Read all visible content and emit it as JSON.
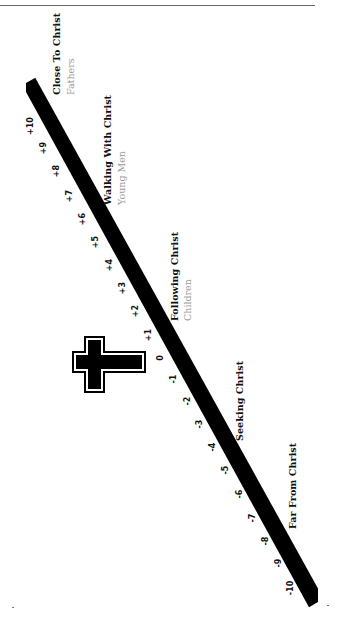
{
  "diagram": {
    "type": "spiritual-growth-scale",
    "bar": {
      "x1": 27,
      "y1": 83,
      "x2": 318,
      "y2": 602,
      "width": 15,
      "color": "#000000"
    },
    "scale": {
      "ticks": [
        {
          "label": "+10",
          "x": 31,
          "y": 126
        },
        {
          "label": "+9",
          "x": 44,
          "y": 148
        },
        {
          "label": "+8",
          "x": 57,
          "y": 171
        },
        {
          "label": "+7",
          "x": 70,
          "y": 196
        },
        {
          "label": "+6",
          "x": 83,
          "y": 219
        },
        {
          "label": "+5",
          "x": 96,
          "y": 242
        },
        {
          "label": "+4",
          "x": 110,
          "y": 265
        },
        {
          "label": "+3",
          "x": 123,
          "y": 288
        },
        {
          "label": "+2",
          "x": 136,
          "y": 311
        },
        {
          "label": "+1",
          "x": 149,
          "y": 335
        },
        {
          "label": "0",
          "x": 161,
          "y": 358
        },
        {
          "label": "-1",
          "x": 174,
          "y": 379
        },
        {
          "label": "-2",
          "x": 188,
          "y": 401
        },
        {
          "label": "-3",
          "x": 200,
          "y": 424
        },
        {
          "label": "-4",
          "x": 213,
          "y": 447
        },
        {
          "label": "-5",
          "x": 226,
          "y": 470
        },
        {
          "label": "-6",
          "x": 240,
          "y": 494
        },
        {
          "label": "-7",
          "x": 253,
          "y": 518
        },
        {
          "label": "-8",
          "x": 266,
          "y": 541
        },
        {
          "label": "-9",
          "x": 279,
          "y": 563
        },
        {
          "label": "-10",
          "x": 291,
          "y": 588
        }
      ]
    },
    "stages": [
      {
        "title": "Close To Christ",
        "subtitle": "Fathers",
        "x": 52,
        "y_bottom": 95,
        "sub_x": 66,
        "sub_y_bottom": 95
      },
      {
        "title": "Walking With Christ",
        "subtitle": "Young Men",
        "x": 103,
        "y_bottom": 205,
        "sub_x": 117,
        "sub_y_bottom": 205
      },
      {
        "title": "Following Christ",
        "subtitle": "Children",
        "x": 170,
        "y_bottom": 321,
        "sub_x": 183,
        "sub_y_bottom": 321
      },
      {
        "title": "Seeking Christ",
        "subtitle": "",
        "x": 235,
        "y_bottom": 441,
        "sub_x": 0,
        "sub_y_bottom": 0
      },
      {
        "title": "Far From Christ",
        "subtitle": "",
        "x": 288,
        "y_bottom": 529,
        "sub_x": 0,
        "sub_y_bottom": 0
      }
    ],
    "cross": {
      "icon": "cross-icon",
      "outer": {
        "left": 72,
        "top": 336,
        "right": 146,
        "bottom": 393
      },
      "crossbar": {
        "left": 84,
        "right": 105
      },
      "long_arm": {
        "top": 351,
        "bottom": 373
      }
    },
    "colors": {
      "ink": "#000000",
      "subtitle": "#9a9a9a",
      "rule": "#6a6a6a",
      "background": "#ffffff"
    }
  }
}
